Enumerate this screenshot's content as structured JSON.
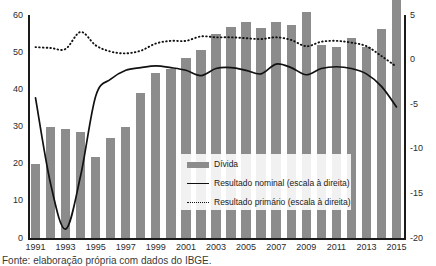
{
  "chart_data": {
    "type": "bar",
    "title": "",
    "xlabel": "",
    "ylabel": "",
    "grid": false,
    "legend_position": "inside-right",
    "categories": [
      1991,
      1992,
      1993,
      1994,
      1995,
      1996,
      1997,
      1998,
      1999,
      2000,
      2001,
      2002,
      2003,
      2004,
      2005,
      2006,
      2007,
      2008,
      2009,
      2010,
      2011,
      2012,
      2013,
      2014,
      2015
    ],
    "x_tick_labels": [
      "1991",
      "1993",
      "1995",
      "1997",
      "1999",
      "2001",
      "2003",
      "2005",
      "2007",
      "2009",
      "2011",
      "2013",
      "2015"
    ],
    "left_axis": {
      "label": "",
      "min": 0,
      "max": 60,
      "ticks": [
        0,
        10,
        20,
        30,
        40,
        50,
        60
      ]
    },
    "right_axis": {
      "label": "",
      "min": -20,
      "max": 5,
      "ticks": [
        5,
        0,
        -5,
        -10,
        -15,
        -20
      ]
    },
    "series": [
      {
        "name": "Dívida",
        "type": "bar",
        "axis": "left",
        "color": "#8c8c8c",
        "values": [
          20.0,
          30.0,
          29.2,
          28.5,
          21.8,
          27.0,
          30.0,
          38.9,
          44.5,
          45.5,
          48.4,
          50.5,
          54.8,
          56.7,
          58.0,
          56.4,
          58.0,
          57.4,
          60.9,
          51.8,
          51.3,
          53.7,
          51.5,
          56.3,
          65.5
        ]
      },
      {
        "name": "Resultado nominal (escala à direita)",
        "type": "line",
        "axis": "right",
        "color": "#111111",
        "style": "solid",
        "values": [
          -4.3,
          -13.9,
          -19.0,
          -13.0,
          -4.1,
          -2.2,
          -1.2,
          -0.9,
          -0.7,
          -0.9,
          -1.2,
          -1.8,
          -1.0,
          -0.9,
          -1.2,
          -1.6,
          -0.5,
          -0.9,
          -1.7,
          -1.0,
          -0.8,
          -1.0,
          -1.6,
          -3.0,
          -5.3
        ]
      },
      {
        "name": "Resultado primário (escala à direita)",
        "type": "line",
        "axis": "right",
        "color": "#111111",
        "style": "dotted",
        "values": [
          1.4,
          1.3,
          1.2,
          3.1,
          1.6,
          0.9,
          0.7,
          1.0,
          1.8,
          2.1,
          2.1,
          2.6,
          2.5,
          2.5,
          2.4,
          2.3,
          2.5,
          2.2,
          1.5,
          2.0,
          2.1,
          1.9,
          1.5,
          0.4,
          -0.8
        ]
      }
    ]
  },
  "legend": {
    "items": [
      {
        "label": "Dívida",
        "marker": "bar-swatch"
      },
      {
        "label": "Resultado nominal (escala à direita)",
        "marker": "solid-line-swatch"
      },
      {
        "label": "Resultado primário (escala à direita)",
        "marker": "dotted-line-swatch"
      }
    ]
  },
  "caption": {
    "text": "Fonte: elaboração própria com dados do IBGE."
  }
}
